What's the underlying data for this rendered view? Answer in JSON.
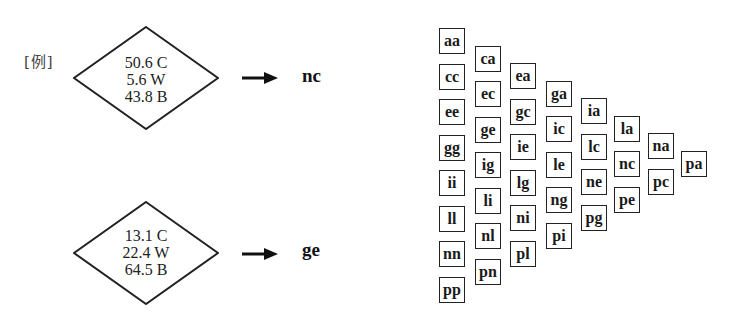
{
  "example_label": "[例]",
  "examples": [
    {
      "lines": [
        "50.6 C",
        "5.6 W",
        "43.8 B"
      ],
      "result": "nc"
    },
    {
      "lines": [
        "13.1 C",
        "22.4 W",
        "64.5 B"
      ],
      "result": "ge"
    }
  ],
  "grid": {
    "columns": [
      [
        "aa",
        "cc",
        "ee",
        "gg",
        "ii",
        "ll",
        "nn",
        "pp"
      ],
      [
        "ca",
        "ec",
        "ge",
        "ig",
        "li",
        "nl",
        "pn"
      ],
      [
        "ea",
        "gc",
        "ie",
        "lg",
        "ni",
        "pl"
      ],
      [
        "ga",
        "ic",
        "le",
        "ng",
        "pi"
      ],
      [
        "ia",
        "lc",
        "ne",
        "pg"
      ],
      [
        "la",
        "nc",
        "pe"
      ],
      [
        "na",
        "pc"
      ],
      [
        "pa"
      ]
    ]
  }
}
